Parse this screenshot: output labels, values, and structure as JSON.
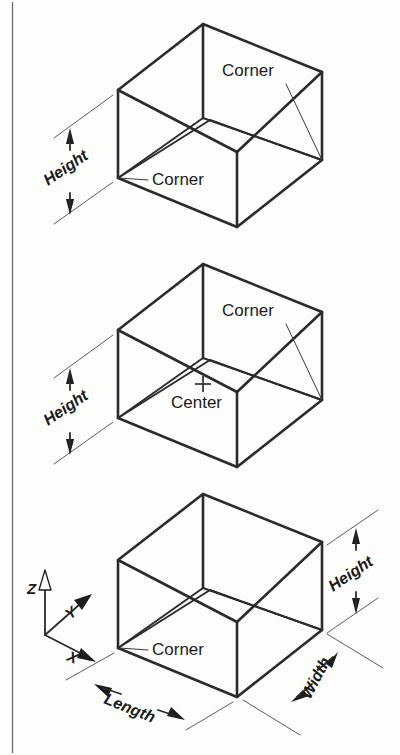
{
  "figure": {
    "kind": "isometric-box-reference-diagram",
    "background_color": "#fdfdfc",
    "line_color": "#2b2b2b",
    "panels": [
      {
        "id": "top",
        "reference_point": "corner",
        "labels": [
          "Corner",
          "Corner",
          "Height"
        ]
      },
      {
        "id": "middle",
        "reference_point": "center",
        "labels": [
          "Corner",
          "Center",
          "Height"
        ]
      },
      {
        "id": "bottom",
        "reference_point": "corner",
        "labels": [
          "Corner",
          "Height",
          "Width",
          "Length"
        ]
      }
    ]
  },
  "panel_top": {
    "corner_upper_label": "Corner",
    "corner_lower_label": "Corner",
    "height_label": "Height"
  },
  "panel_middle": {
    "corner_upper_label": "Corner",
    "center_label": "Center",
    "center_marker": "plus-crosshair",
    "height_label": "Height"
  },
  "panel_bottom": {
    "corner_label": "Corner",
    "height_label": "Height",
    "width_label": "Width",
    "length_label": "Length"
  },
  "axis_triad": {
    "z_label": "Z",
    "y_label": "Y",
    "x_label": "X"
  }
}
